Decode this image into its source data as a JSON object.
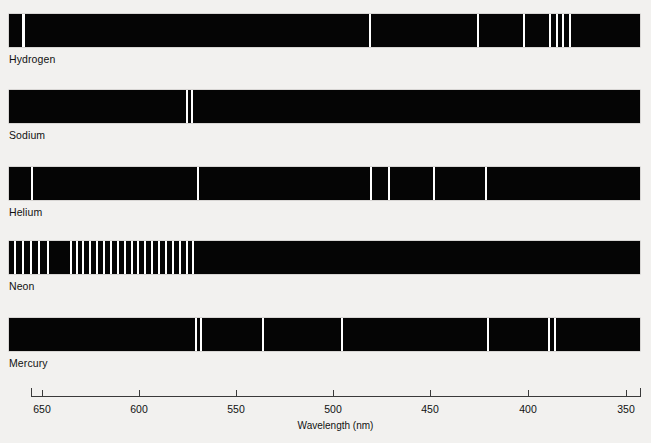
{
  "figure": {
    "background_color": "#f2f1ef",
    "strip_color": "#050505",
    "line_color": "#ffffff",
    "axis_color": "#3a3a3a",
    "text_color": "#111111"
  },
  "axis": {
    "title": "Wavelength (nm)",
    "unit": "nm",
    "direction": "decreasing",
    "min_label": "350",
    "max_label": "650",
    "ticks": [
      {
        "label": "650",
        "value": 650,
        "x": 42
      },
      {
        "label": "600",
        "value": 600,
        "x": 139
      },
      {
        "label": "550",
        "value": 550,
        "x": 236
      },
      {
        "label": "500",
        "value": 500,
        "x": 333
      },
      {
        "label": "450",
        "value": 450,
        "x": 430
      },
      {
        "label": "400",
        "value": 400,
        "x": 528
      },
      {
        "label": "350",
        "value": 350,
        "x": 626
      }
    ],
    "left_end_x": 31,
    "right_end_x": 640,
    "y": 396
  },
  "chart_data": {
    "type": "bar",
    "xlabel": "Wavelength (nm)",
    "ylabel": "",
    "xlim": [
      672,
      344
    ],
    "grid": false,
    "legend": "none",
    "categories": [
      "Hydrogen",
      "Sodium",
      "Helium",
      "Neon",
      "Mercury"
    ],
    "series": [
      {
        "name": "Hydrogen",
        "label": "Hydrogen",
        "strip": {
          "x": 9,
          "y": 14,
          "width": 631,
          "height": 33
        },
        "lines_px": [
          22,
          369,
          477,
          523,
          549,
          556,
          562,
          569
        ],
        "lines_nm": [
          656,
          486,
          434,
          410,
          397,
          389,
          384,
          380
        ],
        "line_widths_px": [
          3,
          2,
          2,
          2,
          2,
          2,
          2,
          2
        ]
      },
      {
        "name": "Sodium",
        "label": "Sodium",
        "strip": {
          "x": 9,
          "y": 90,
          "width": 631,
          "height": 33
        },
        "lines_px": [
          186,
          191
        ],
        "lines_nm": [
          589,
          589
        ],
        "line_widths_px": [
          2,
          2
        ]
      },
      {
        "name": "Helium",
        "label": "Helium",
        "strip": {
          "x": 9,
          "y": 167,
          "width": 631,
          "height": 33
        },
        "lines_px": [
          31,
          197,
          370,
          388,
          433,
          485
        ],
        "lines_nm": [
          668,
          588,
          502,
          492,
          471,
          447
        ],
        "line_widths_px": [
          2,
          2,
          2,
          2,
          2,
          2
        ]
      },
      {
        "name": "Neon",
        "label": "Neon",
        "strip": {
          "x": 9,
          "y": 241,
          "width": 631,
          "height": 33
        },
        "lines_px": [
          14,
          22,
          30,
          38,
          47,
          70,
          76,
          82,
          89,
          96,
          103,
          110,
          117,
          124,
          131,
          137,
          144,
          151,
          158,
          165,
          172,
          179,
          186,
          192
        ],
        "lines_nm": [
          660,
          656,
          653,
          650,
          645,
          633,
          630,
          627,
          624,
          621,
          618,
          614,
          611,
          608,
          605,
          602,
          599,
          596,
          593,
          590,
          587,
          584,
          581,
          578
        ],
        "line_widths_px": [
          2,
          2,
          2,
          2,
          2,
          2,
          2,
          2,
          2,
          2,
          2,
          2,
          2,
          2,
          2,
          2,
          2,
          2,
          2,
          2,
          2,
          2,
          2,
          2
        ]
      },
      {
        "name": "Mercury",
        "label": "Mercury",
        "strip": {
          "x": 9,
          "y": 318,
          "width": 631,
          "height": 33
        },
        "lines_px": [
          195,
          200,
          262,
          341,
          487,
          548,
          554
        ],
        "lines_nm": [
          579,
          577,
          546,
          496,
          436,
          405,
          402
        ],
        "line_widths_px": [
          2,
          2,
          2,
          2,
          2,
          2,
          2
        ]
      }
    ]
  }
}
